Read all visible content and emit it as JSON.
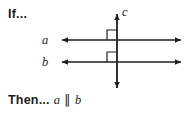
{
  "figure": {
    "type": "geometry-diagram",
    "background_color": "#ffffff",
    "stroke_color": "#231f20",
    "if_label": "If...",
    "then_label": "Then...",
    "conclusion": {
      "left_line": "a",
      "relation_symbol": "∥",
      "right_line": "b"
    },
    "lines": [
      {
        "name": "a",
        "label": "a",
        "orientation": "horizontal",
        "arrowheads": "both",
        "y": 40,
        "x_start": 62,
        "x_end": 181,
        "label_x": 45,
        "label_y": 44
      },
      {
        "name": "b",
        "label": "b",
        "orientation": "horizontal",
        "arrowheads": "both",
        "y": 62,
        "x_start": 62,
        "x_end": 181,
        "label_x": 45,
        "label_y": 66
      },
      {
        "name": "c",
        "label": "c",
        "orientation": "vertical",
        "arrowheads": "both",
        "x": 117,
        "y_start": 14,
        "y_end": 88,
        "label_x": 122,
        "label_y": 15
      }
    ],
    "right_angle_marks": [
      {
        "at_intersection": "a-and-c",
        "x": 107,
        "y": 30,
        "size": 10,
        "quadrant": "upper-left"
      },
      {
        "at_intersection": "b-and-c",
        "x": 107,
        "y": 52,
        "size": 10,
        "quadrant": "upper-left"
      }
    ]
  }
}
